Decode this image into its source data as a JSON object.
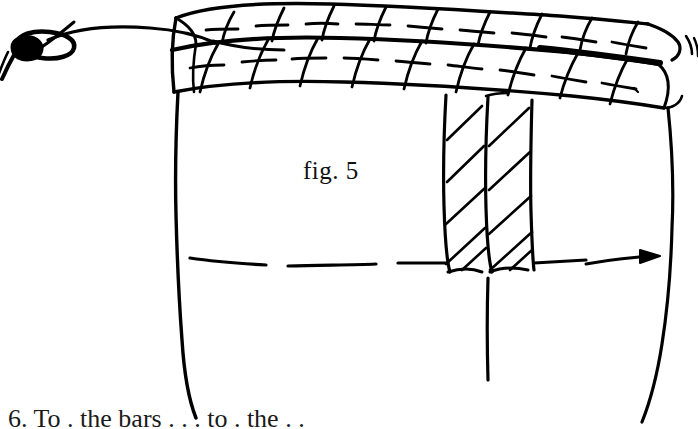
{
  "page": {
    "background_color": "#ffffff",
    "ink_color": "#000000",
    "width": 698,
    "height": 429,
    "kind": "hand-drawn-technical-sketch"
  },
  "figure": {
    "label": "fig. 5",
    "elements": {
      "knot_label": "line-knot",
      "string_label": "mason-line",
      "coping_label": "brick-courses",
      "pier_label": "hatched-pier",
      "centerline_label": "dashed-course-line",
      "arrow_label": "direction-arrow",
      "plumb_label": "plumb-line",
      "left_wall_label": "left-wall-edge",
      "right_wall_label": "right-wall-edge"
    }
  },
  "caption": {
    "text": "6.  To . the bars . . . to . the . ."
  },
  "drawing": {
    "stroke_color": "#000000",
    "stroke_width_thin": 2.2,
    "stroke_width_medium": 3.0,
    "stroke_width_thick": 4.0
  }
}
